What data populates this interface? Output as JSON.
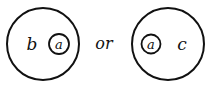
{
  "diagram": {
    "left_set": {
      "outer_label": "b",
      "inner_label": "a"
    },
    "connector": "or",
    "right_set": {
      "inner_label": "a",
      "outer_label": "c"
    },
    "colors": {
      "stroke": "#111111",
      "background": "#ffffff"
    }
  }
}
